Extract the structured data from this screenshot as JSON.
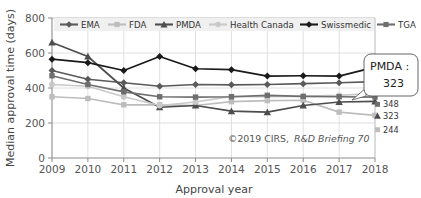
{
  "chart_data": {
    "type": "line",
    "title": "",
    "xlabel": "Approval year",
    "ylabel": "Median approval time (days)",
    "x": [
      2009,
      2010,
      2011,
      2012,
      2013,
      2014,
      2015,
      2016,
      2017,
      2018
    ],
    "xtick_labels": [
      "2009",
      "2010",
      "2011",
      "2012",
      "2013",
      "2014",
      "2015",
      "2016",
      "2017",
      "2018"
    ],
    "ytick_labels": [
      "0",
      "200",
      "400",
      "600",
      "800"
    ],
    "ytick_values": [
      0,
      200,
      400,
      600,
      800
    ],
    "ylim": [
      0,
      800
    ],
    "xlim": [
      2009,
      2018
    ],
    "grid": true,
    "grid_axis": "both",
    "legend_position": "top",
    "series": [
      {
        "name": "EMA",
        "color": "#5a5a5a",
        "marker": "diamond",
        "values": [
          500,
          450,
          430,
          410,
          420,
          418,
          420,
          425,
          430,
          436
        ],
        "end_label": "436"
      },
      {
        "name": "FDA",
        "color": "#bdbdbd",
        "marker": "square",
        "values": [
          350,
          340,
          304,
          304,
          300,
          322,
          328,
          330,
          262,
          244
        ],
        "end_label": "244"
      },
      {
        "name": "PMDA",
        "color": "#4d4d4d",
        "marker": "triangle",
        "values": [
          660,
          580,
          400,
          290,
          300,
          268,
          262,
          300,
          320,
          323
        ],
        "end_label": "323"
      },
      {
        "name": "Health Canada",
        "color": "#c9c9c9",
        "marker": "circle",
        "values": [
          420,
          410,
          350,
          300,
          320,
          352,
          350,
          352,
          358,
          369
        ],
        "end_label": "369"
      },
      {
        "name": "Swissmedic",
        "color": "#1a1a1a",
        "marker": "diamond",
        "values": [
          565,
          545,
          500,
          580,
          510,
          505,
          468,
          470,
          468,
          519
        ],
        "end_label": "519"
      },
      {
        "name": "TGA",
        "color": "#6e6e6e",
        "marker": "square",
        "values": [
          470,
          420,
          378,
          350,
          348,
          350,
          358,
          352,
          350,
          348
        ],
        "end_label": "348"
      }
    ],
    "annotations": [
      {
        "name": "pmda-callout",
        "label": "PMDA :",
        "value": "323",
        "points_to_series": "PMDA",
        "points_to_x": 2018
      },
      {
        "name": "credit",
        "prefix": "©2019 CIRS,",
        "italic": "R&D Briefing 70"
      }
    ]
  }
}
